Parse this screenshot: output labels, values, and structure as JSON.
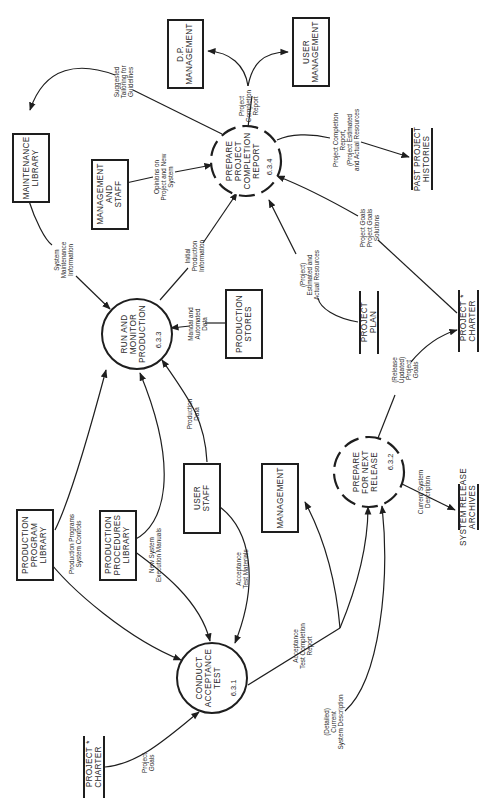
{
  "diagram": {
    "type": "data-flow-diagram",
    "orientation": "rotated-90-clockwise",
    "processes": [
      {
        "id": "6.3.1",
        "lines": [
          "CONDUCT",
          "ACCEPTANCE",
          "TEST"
        ],
        "number": "6.3.1",
        "style": "solid"
      },
      {
        "id": "6.3.2",
        "lines": [
          "PREPARE",
          "FOR NEXT",
          "RELEASE"
        ],
        "number": "6.3.2",
        "style": "dashed"
      },
      {
        "id": "6.3.3",
        "lines": [
          "RUN AND",
          "MONITOR",
          "PRODUCTION"
        ],
        "number": "6.3.3",
        "style": "solid"
      },
      {
        "id": "6.3.4",
        "lines": [
          "PREPARE",
          "PROJECT",
          "COMPLETION",
          "REPORT"
        ],
        "number": "6.3.4",
        "style": "dashed"
      }
    ],
    "entities": [
      {
        "id": "production-program-library",
        "lines": [
          "PRODUCTION",
          "PROGRAM",
          "LIBRARY"
        ]
      },
      {
        "id": "production-procedures-library",
        "lines": [
          "PRODUCTION",
          "PROCEDURES",
          "LIBRARY"
        ]
      },
      {
        "id": "user-staff",
        "lines": [
          "USER",
          "STAFF"
        ]
      },
      {
        "id": "management",
        "lines": [
          "MANAGEMENT"
        ]
      },
      {
        "id": "production-stores",
        "lines": [
          "PRODUCTION",
          "STORES"
        ]
      },
      {
        "id": "maintenance-library",
        "lines": [
          "MAINTENANCE",
          "LIBRARY"
        ]
      },
      {
        "id": "management-and-staff",
        "lines": [
          "MANAGEMENT",
          "AND",
          "STAFF"
        ]
      },
      {
        "id": "dp-management",
        "lines": [
          "D.P.",
          "MANAGEMENT"
        ]
      },
      {
        "id": "user-management",
        "lines": [
          "USER",
          "MANAGEMENT"
        ]
      }
    ],
    "stores": [
      {
        "id": "project-charter-a",
        "lines": [
          "PROJECT",
          "CHARTER"
        ],
        "mark": "*"
      },
      {
        "id": "project-charter-b",
        "lines": [
          "PROJECT",
          "CHARTER"
        ],
        "mark": "*"
      },
      {
        "id": "project-plan",
        "lines": [
          "PROJECT",
          "PLAN"
        ],
        "mark": ""
      },
      {
        "id": "system-release-archives",
        "lines": [
          "SYSTEM RELEASE",
          "ARCHIVES"
        ],
        "mark": ""
      },
      {
        "id": "past-project-histories",
        "lines": [
          "PAST PROJECT",
          "HISTORIES"
        ],
        "mark": ""
      }
    ],
    "flows": [
      {
        "id": "f-project-goals",
        "lines": [
          "Project",
          "Goals"
        ],
        "from": "project-charter-a",
        "to": "6.3.1"
      },
      {
        "id": "f-production-programs",
        "lines": [
          "Production  Programs",
          "System Controls"
        ],
        "from": "production-program-library",
        "to": "6.3.1 / 6.3.3"
      },
      {
        "id": "f-new-system-exec",
        "lines": [
          "New System",
          "Execution Manuals"
        ],
        "from": "production-procedures-library",
        "to": "6.3.1 / 6.3.3"
      },
      {
        "id": "f-acceptance-materials",
        "lines": [
          "Acceptance",
          "Test Materials"
        ],
        "from": "user-staff",
        "to": "6.3.1"
      },
      {
        "id": "f-production-data",
        "lines": [
          "Production",
          "Data"
        ],
        "from": "user-staff",
        "to": "6.3.3"
      },
      {
        "id": "f-acceptance-report",
        "lines": [
          "Acceptance",
          "Test Completion",
          "Report"
        ],
        "from": "6.3.1",
        "to": "management / 6.3.2"
      },
      {
        "id": "f-detailed-current",
        "lines": [
          "(Detailed)",
          "Current",
          "System Description"
        ],
        "from": "6.3.1",
        "to": "6.3.2"
      },
      {
        "id": "f-current-system",
        "lines": [
          "Current System",
          "Description"
        ],
        "from": "6.3.2",
        "to": "system-release-archives"
      },
      {
        "id": "f-release-goals",
        "lines": [
          "(Release",
          "Updated)",
          "Project",
          "Goals"
        ],
        "from": "6.3.2",
        "to": "project-charter-b"
      },
      {
        "id": "f-manual-automated",
        "lines": [
          "Manual and",
          "Automated",
          "Data"
        ],
        "from": "production-stores",
        "to": "6.3.3"
      },
      {
        "id": "f-initial-production",
        "lines": [
          "Initial",
          "Production",
          "Information"
        ],
        "from": "6.3.3",
        "to": "6.3.4"
      },
      {
        "id": "f-system-maintenance",
        "lines": [
          "System",
          "Maintenance",
          "Information"
        ],
        "from": "maintenance-library",
        "to": "6.3.3"
      },
      {
        "id": "f-opinions",
        "lines": [
          "Opinions on",
          "Project and New",
          "System"
        ],
        "from": "management-and-staff",
        "to": "6.3.4"
      },
      {
        "id": "f-suggested-tailoring",
        "lines": [
          "Suggested",
          "Tailoring for",
          "Guidelines"
        ],
        "from": "6.3.4",
        "to": "maintenance-library"
      },
      {
        "id": "f-project-completion",
        "lines": [
          "Project",
          "Completion",
          "Report"
        ],
        "from": "6.3.4",
        "to": "dp-management / user-management"
      },
      {
        "id": "f-completion-histories",
        "lines": [
          "Project Completion",
          "Report,",
          "(Project Estimated",
          "and Actual Resources"
        ],
        "from": "6.3.4",
        "to": "past-project-histories"
      },
      {
        "id": "f-estimated-actual",
        "lines": [
          "(Project)",
          "Estimated and",
          "Actual Resources"
        ],
        "from": "project-plan",
        "to": "6.3.4"
      },
      {
        "id": "f-goals-solutions",
        "lines": [
          "Project Goals",
          "Project Goals",
          "Solutions"
        ],
        "from": "project-charter-b",
        "to": "6.3.4"
      }
    ]
  }
}
